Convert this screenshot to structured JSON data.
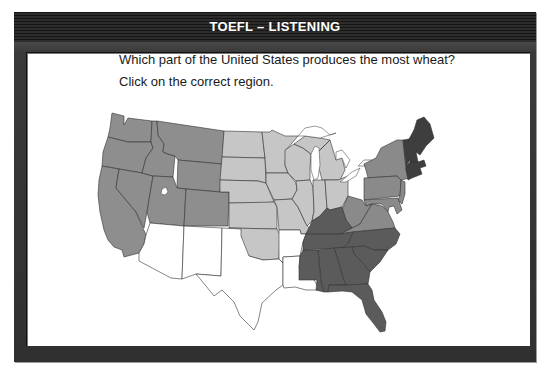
{
  "window": {
    "title": "TOEFL – LISTENING"
  },
  "question": {
    "prompt": "Which part of the United States produces the most wheat?",
    "instruction": "Click on the correct region."
  },
  "map": {
    "type": "clickable-region-map",
    "subject": "United States",
    "regions": [
      {
        "id": "west",
        "label": "Western states",
        "states": [
          "WA",
          "OR",
          "CA",
          "NV",
          "ID",
          "MT",
          "WY",
          "UT",
          "CO"
        ],
        "color": "#8e8e8e"
      },
      {
        "id": "plains-midwest",
        "label": "Great Plains and Midwest",
        "states": [
          "ND",
          "SD",
          "NE",
          "KS",
          "OK",
          "MN",
          "IA",
          "MO",
          "WI",
          "IL",
          "MI",
          "IN",
          "OH"
        ],
        "color": "#c6c6c6"
      },
      {
        "id": "southwest-south-central",
        "label": "Southwest and South Central",
        "states": [
          "AZ",
          "NM",
          "TX",
          "AR",
          "LA"
        ],
        "color": "#ffffff"
      },
      {
        "id": "mid-atlantic",
        "label": "Mid-Atlantic",
        "states": [
          "NY",
          "PA",
          "NJ",
          "DE",
          "MD",
          "WV",
          "VA"
        ],
        "color": "#8a8a8a"
      },
      {
        "id": "southeast",
        "label": "Southeast",
        "states": [
          "KY",
          "TN",
          "NC",
          "SC",
          "GA",
          "FL",
          "AL",
          "MS"
        ],
        "color": "#5b5b5b"
      },
      {
        "id": "new-england",
        "label": "New England",
        "states": [
          "ME",
          "NH",
          "VT",
          "MA",
          "CT",
          "RI"
        ],
        "color": "#3e3e3e"
      }
    ]
  }
}
